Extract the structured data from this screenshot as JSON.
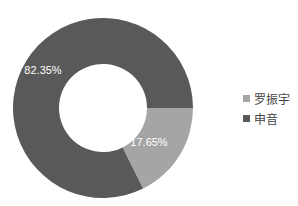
{
  "chart_data": {
    "type": "pie",
    "donut": true,
    "title": "",
    "categories": [
      "罗振宇",
      "申音"
    ],
    "values": [
      17.65,
      82.35
    ],
    "labels": [
      "17.65%",
      "82.35%"
    ],
    "colors": [
      "#a5a5a5",
      "#595959"
    ],
    "legend_position": "right"
  },
  "legend": {
    "items": [
      {
        "label": "罗振宇",
        "color": "#a5a5a5"
      },
      {
        "label": "申音",
        "color": "#595959"
      }
    ]
  }
}
